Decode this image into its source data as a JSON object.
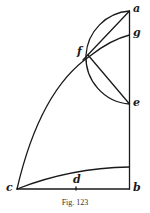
{
  "figure": {
    "caption": "Fig. 123",
    "stroke_color": "#1a1a1a",
    "labels": {
      "a": "a",
      "g": "g",
      "f": "f",
      "e": "e",
      "c": "c",
      "d": "d",
      "b": "b"
    }
  }
}
